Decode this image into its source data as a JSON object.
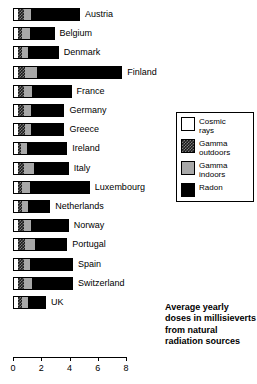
{
  "chart_data": {
    "type": "bar",
    "orientation": "horizontal",
    "stacked": true,
    "title": "",
    "caption": "Average yearly doses in millisieverts from natural radiation sources",
    "xlabel": "",
    "ylabel": "",
    "xlim": [
      0,
      8
    ],
    "xticks": [
      0,
      2,
      4,
      6,
      8
    ],
    "xtick_labels": [
      "0",
      "2",
      "4",
      "6",
      "8"
    ],
    "grid": false,
    "legend_position": "right",
    "units": "millisieverts per year",
    "series": [
      {
        "name": "Cosmic rays",
        "key": "cosmic",
        "color": "#ffffff",
        "pattern": "solid-white",
        "values": [
          0.3,
          0.3,
          0.3,
          0.3,
          0.3,
          0.3,
          0.3,
          0.3,
          0.3,
          0.3,
          0.3,
          0.3,
          0.3,
          0.3,
          0.3,
          0.3
        ]
      },
      {
        "name": "Gamma outdoors",
        "key": "gamma_outdoors",
        "color": "#1a1a1a",
        "pattern": "checkered-dark",
        "values": [
          0.4,
          0.3,
          0.3,
          0.5,
          0.4,
          0.4,
          0.5,
          0.2,
          0.4,
          0.3,
          0.3,
          0.4,
          0.5,
          0.4,
          0.4,
          0.3
        ]
      },
      {
        "name": "Gamma indoors",
        "key": "gamma_indoors",
        "color": "#a8a8a8",
        "pattern": "solid-gray",
        "values": [
          0.5,
          0.5,
          0.4,
          0.8,
          0.6,
          0.5,
          0.4,
          0.4,
          0.7,
          0.5,
          0.4,
          0.5,
          0.7,
          0.4,
          0.6,
          0.4
        ]
      },
      {
        "name": "Radon",
        "key": "radon",
        "color": "#000000",
        "pattern": "solid-black",
        "values": [
          3.4,
          1.7,
          2.1,
          6.0,
          2.7,
          2.3,
          2.3,
          2.8,
          2.4,
          4.2,
          1.5,
          2.6,
          2.2,
          3.0,
          2.8,
          1.2
        ]
      }
    ],
    "categories": [
      "Austria",
      "Belgium",
      "Denmark",
      "Finland",
      "France",
      "Germany",
      "Greece",
      "Ireland",
      "Italy",
      "Luxembourg",
      "Netherlands",
      "Norway",
      "Portugal",
      "Spain",
      "Switzerland",
      "UK"
    ],
    "totals": [
      4.6,
      2.8,
      3.1,
      7.6,
      4.0,
      3.5,
      3.5,
      3.7,
      3.8,
      5.3,
      2.5,
      3.8,
      3.7,
      4.1,
      4.1,
      2.2
    ]
  },
  "legend": {
    "items": [
      {
        "label": "Cosmic\nrays",
        "swatch": "cosmic-rays-swatch"
      },
      {
        "label": "Gamma\noutdoors",
        "swatch": "gamma-outdoors-swatch"
      },
      {
        "label": "Gamma\nindoors",
        "swatch": "gamma-indoors-swatch"
      },
      {
        "label": "Radon",
        "swatch": "radon-swatch"
      }
    ]
  }
}
